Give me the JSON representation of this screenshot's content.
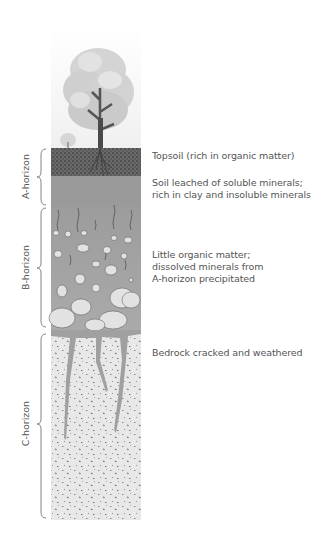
{
  "diagram": {
    "horizons": [
      {
        "id": "A",
        "label": "A-horizon"
      },
      {
        "id": "B",
        "label": "B-horizon"
      },
      {
        "id": "C",
        "label": "C-horizon"
      }
    ],
    "descriptions": [
      {
        "line1": "Topsoil (rich in organic matter)"
      },
      {
        "line1": "Soil leached of soluble minerals;",
        "line2": "rich in clay and insoluble minerals"
      },
      {
        "line1": "Little organic matter;",
        "line2": "dissolved minerals from",
        "line3": "A-horizon precipitated"
      },
      {
        "line1": "Bedrock cracked and weathered"
      }
    ],
    "colors": {
      "topsoil": "#5a5a5a",
      "leached": "#9a9a9a",
      "b_horizon": "#a8a8a8",
      "bedrock": "#e6e6e6",
      "rock": "#dedede",
      "text": "#555555",
      "brace": "#777777"
    }
  }
}
